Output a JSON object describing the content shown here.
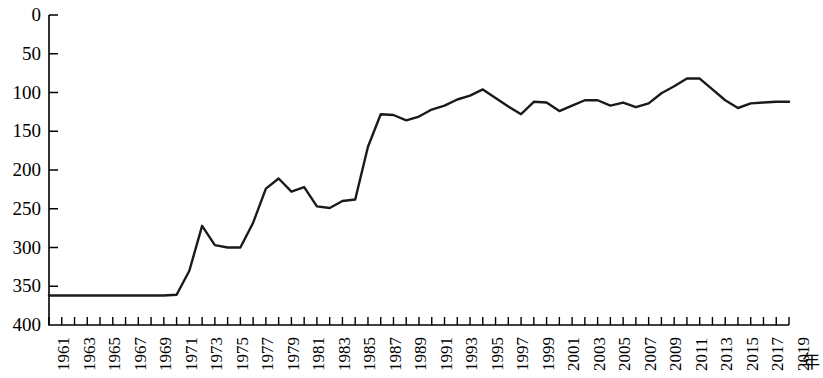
{
  "chart_data": {
    "type": "line",
    "title": "",
    "xlabel": "年",
    "ylabel": "",
    "xlim": [
      1961,
      2019
    ],
    "ylim": [
      0,
      400
    ],
    "y_axis_inverted": true,
    "y_ticks": [
      0,
      50,
      100,
      150,
      200,
      250,
      300,
      350,
      400
    ],
    "x_ticks": [
      1961,
      1963,
      1965,
      1967,
      1969,
      1971,
      1973,
      1975,
      1977,
      1979,
      1981,
      1983,
      1985,
      1987,
      1989,
      1991,
      1993,
      1995,
      1997,
      1999,
      2001,
      2003,
      2005,
      2007,
      2009,
      2011,
      2013,
      2015,
      2017,
      2019
    ],
    "grid": false,
    "legend": "none",
    "line_color": "#1a1a1a",
    "line_width": 2.4,
    "x": [
      1961,
      1962,
      1963,
      1964,
      1965,
      1966,
      1967,
      1968,
      1969,
      1970,
      1971,
      1972,
      1973,
      1974,
      1975,
      1976,
      1977,
      1978,
      1979,
      1980,
      1981,
      1982,
      1983,
      1984,
      1985,
      1986,
      1987,
      1988,
      1989,
      1990,
      1991,
      1992,
      1993,
      1994,
      1995,
      1996,
      1997,
      1998,
      1999,
      2000,
      2001,
      2002,
      2003,
      2004,
      2005,
      2006,
      2007,
      2008,
      2009,
      2010,
      2011,
      2012,
      2013,
      2014,
      2015,
      2016,
      2017,
      2018,
      2019
    ],
    "values": [
      362,
      362,
      362,
      362,
      362,
      362,
      362,
      362,
      362,
      362,
      361,
      330,
      272,
      297,
      300,
      300,
      268,
      224,
      211,
      228,
      222,
      247,
      249,
      240,
      238,
      170,
      128,
      129,
      136,
      131,
      122,
      117,
      109,
      104,
      96,
      107,
      118,
      128,
      112,
      113,
      124,
      117,
      110,
      110,
      117,
      113,
      119,
      114,
      101,
      92,
      82,
      82,
      96,
      110,
      120,
      114,
      113,
      112,
      112
    ]
  }
}
